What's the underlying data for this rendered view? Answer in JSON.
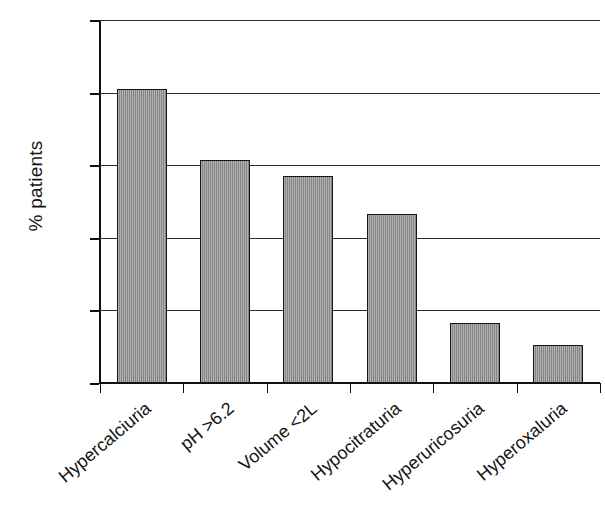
{
  "chart_data": {
    "type": "bar",
    "title": "",
    "subtitle": "",
    "xlabel": "",
    "ylabel": "% patients",
    "ylim": [
      0,
      100
    ],
    "yticks": [
      0,
      20,
      40,
      60,
      80,
      100
    ],
    "ytick_labels": [
      "0",
      "20",
      "40",
      "60",
      "80",
      "100"
    ],
    "grid": true,
    "grid_axis": "y",
    "legend": false,
    "legend_position": "none",
    "bar_color": "#8e8e8e",
    "bar_edge_color": "#171717",
    "categories": [
      "Hypercalciuria",
      "pH >6.2",
      "Volume <2L",
      "Hypocitraturia",
      "Hyperuricosuria",
      "Hyperoxaluria"
    ],
    "values": [
      81,
      61.5,
      57,
      46.5,
      16.5,
      10.5
    ],
    "series": [
      {
        "name": "% patients",
        "values": [
          81,
          61.5,
          57,
          46.5,
          16.5,
          10.5
        ]
      }
    ]
  }
}
